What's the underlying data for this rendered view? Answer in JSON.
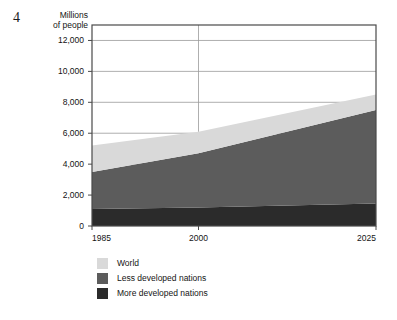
{
  "figure": {
    "number": "4"
  },
  "axis": {
    "y_title": "Millions\nof people"
  },
  "legend": {
    "items": [
      {
        "label": "World",
        "color": "#d9d9d9"
      },
      {
        "label": "Less developed nations",
        "color": "#5c5c5c"
      },
      {
        "label": "More developed nations",
        "color": "#2b2b2b"
      }
    ]
  },
  "chart_data": {
    "type": "area",
    "stacked": true,
    "title": "",
    "xlabel": "",
    "ylabel": "Millions of people",
    "x": [
      1985,
      2000,
      2025
    ],
    "xtick_labels": [
      "1985",
      "2000",
      "2025"
    ],
    "xlim": [
      1985,
      2025
    ],
    "ylim": [
      0,
      13000
    ],
    "yticks": [
      0,
      2000,
      4000,
      6000,
      8000,
      10000,
      12000
    ],
    "ytick_labels": [
      "0",
      "2,000",
      "4,000",
      "6,000",
      "8,000",
      "10,000",
      "12,000"
    ],
    "grid": "horizontal-plus-2000-vertical",
    "legend_position": "below-left",
    "series": [
      {
        "name": "More developed nations",
        "color": "#2b2b2b",
        "values": [
          1100,
          1200,
          1450
        ]
      },
      {
        "name": "Less developed nations",
        "color": "#5c5c5c",
        "values": [
          2400,
          3500,
          6050
        ]
      },
      {
        "name": "World",
        "color": "#d9d9d9",
        "values": [
          1700,
          1400,
          1000
        ]
      }
    ],
    "cumulative_totals": {
      "more_developed": [
        1100,
        1200,
        1450
      ],
      "more_plus_less": [
        3500,
        4700,
        7500
      ],
      "world_total": [
        5200,
        6100,
        8500
      ]
    },
    "annotations": []
  }
}
